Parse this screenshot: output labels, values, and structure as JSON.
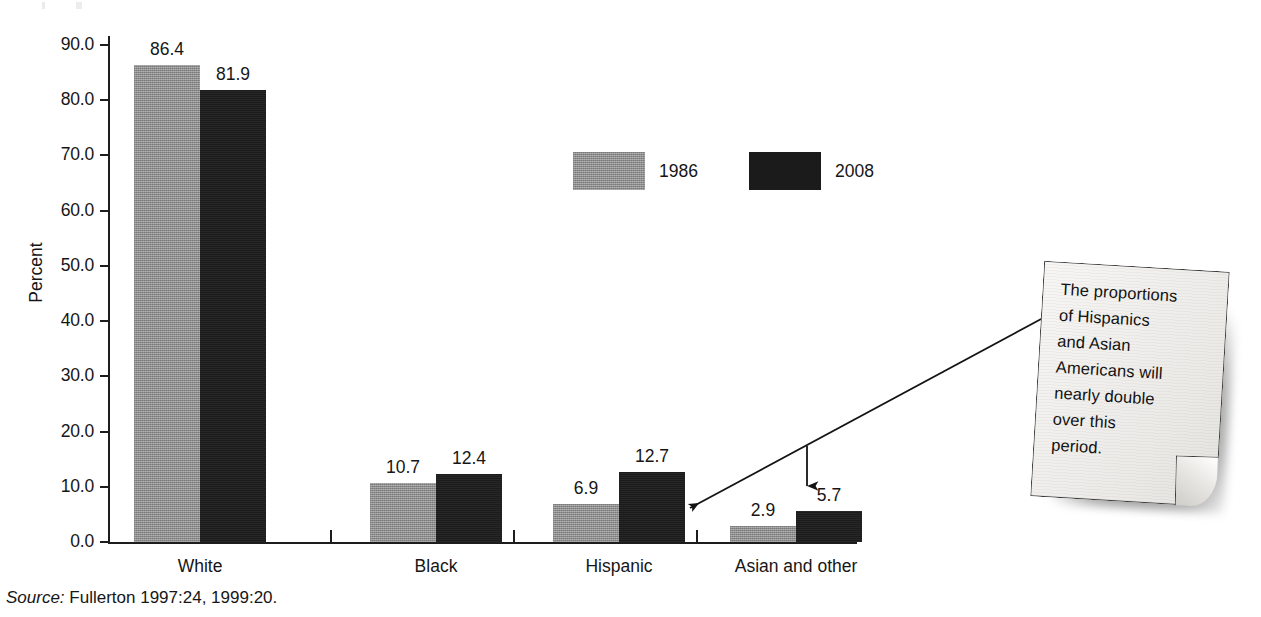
{
  "chart_data": {
    "type": "bar",
    "title": "",
    "subtitle": "",
    "xlabel": "",
    "ylabel": "Percent",
    "ylim": [
      0.0,
      90.0
    ],
    "ytick_step": 10.0,
    "grid": false,
    "legend_position": "inside-upper-center",
    "categories": [
      "White",
      "Black",
      "Hispanic",
      "Asian and other"
    ],
    "series": [
      {
        "name": "1986",
        "color": "#8d8d8d",
        "values": [
          86.4,
          10.7,
          6.9,
          2.9
        ]
      },
      {
        "name": "2008",
        "color": "#1b1b1b",
        "values": [
          81.9,
          12.4,
          12.7,
          5.7
        ]
      }
    ],
    "ytick_labels": [
      "90.0",
      "80.0",
      "70.0",
      "60.0",
      "50.0",
      "40.0",
      "30.0",
      "20.0",
      "10.0",
      "0.0"
    ],
    "value_labels": [
      [
        "86.4",
        "81.9"
      ],
      [
        "10.7",
        "12.4"
      ],
      [
        "6.9",
        "12.7"
      ],
      [
        "2.9",
        "5.7"
      ]
    ],
    "annotations": [
      {
        "name": "callout-note",
        "text": "The proportions of Hispanics and Asian Americans will nearly double over this period.",
        "lines": [
          "The proportions",
          "of Hispanics",
          "and Asian",
          "Americans will",
          "nearly double",
          "over this",
          "period."
        ],
        "points_to": [
          "Hispanic",
          "Asian and other"
        ]
      }
    ]
  },
  "legend": {
    "entries": [
      {
        "label": "1986",
        "color": "#8d8d8d"
      },
      {
        "label": "2008",
        "color": "#1b1b1b"
      }
    ]
  },
  "axis": {
    "y_title": "Percent"
  },
  "source": {
    "prefix": "Source:",
    "text": "Fullerton 1997:24, 1999:20."
  },
  "colors": {
    "series_1986": "#8d8d8d",
    "series_2008": "#1b1b1b",
    "axis": "#1d1d1d",
    "text": "#161616",
    "note_paper": "#f2f1ef"
  }
}
